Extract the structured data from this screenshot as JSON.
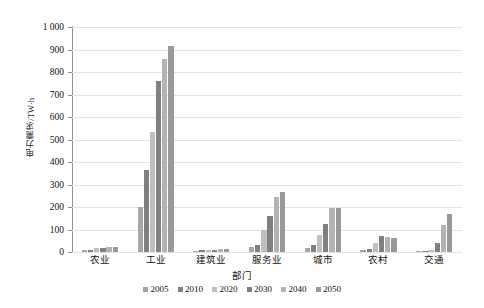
{
  "chart_data": {
    "type": "bar",
    "title": "",
    "xlabel": "部门",
    "ylabel": "电力需求/TW·h",
    "ylim": [
      0,
      1000
    ],
    "ytick_step": 100,
    "yticks": [
      "0",
      "100",
      "200",
      "300",
      "400",
      "500",
      "600",
      "700",
      "800",
      "900",
      "1 000"
    ],
    "grid": true,
    "legend_position": "bottom",
    "categories": [
      "农业",
      "工业",
      "建筑业",
      "服务业",
      "城市",
      "农村",
      "交通"
    ],
    "series": [
      {
        "name": "2005",
        "color": "#a6a6a6",
        "values": [
          8,
          200,
          5,
          22,
          18,
          10,
          5
        ]
      },
      {
        "name": "2010",
        "color": "#7f7f7f",
        "values": [
          11,
          365,
          7,
          30,
          30,
          14,
          6
        ]
      },
      {
        "name": "2020",
        "color": "#bfbfbf",
        "values": [
          16,
          535,
          9,
          100,
          75,
          38,
          8
        ]
      },
      {
        "name": "2030",
        "color": "#808080",
        "values": [
          20,
          760,
          11,
          160,
          125,
          72,
          38
        ]
      },
      {
        "name": "2040",
        "color": "#b3b3b3",
        "values": [
          22,
          858,
          12,
          245,
          195,
          65,
          120
        ]
      },
      {
        "name": "2050",
        "color": "#999999",
        "values": [
          23,
          915,
          12,
          265,
          195,
          62,
          168
        ]
      }
    ]
  },
  "legend": {
    "items": [
      {
        "label": "2005"
      },
      {
        "label": "2010"
      },
      {
        "label": "2020"
      },
      {
        "label": "2030"
      },
      {
        "label": "2040"
      },
      {
        "label": "2050"
      }
    ]
  }
}
